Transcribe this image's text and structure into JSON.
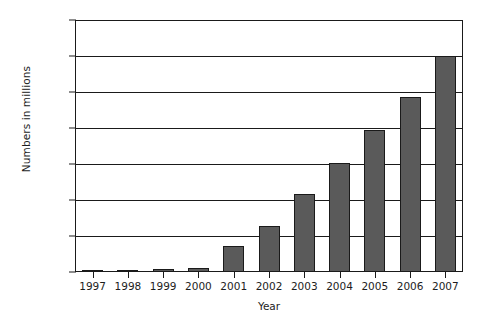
{
  "chart_data": {
    "type": "bar",
    "title": "",
    "xlabel": "Year",
    "ylabel": "Numbers in millions",
    "categories": [
      "1997",
      "1998",
      "1999",
      "2000",
      "2001",
      "2002",
      "2003",
      "2004",
      "2005",
      "2006",
      "2007"
    ],
    "values": [
      1,
      2,
      7,
      10,
      72,
      128,
      218,
      303,
      395,
      487,
      600
    ],
    "ylim": [
      0,
      700
    ],
    "ytick_labels": [
      "0",
      "100",
      "200",
      "300",
      "400",
      "500",
      "600",
      "700"
    ],
    "ytick_values": [
      0,
      100,
      200,
      300,
      400,
      500,
      600,
      700
    ],
    "grid": true,
    "legend": false,
    "series": [
      {
        "name": "Numbers in millions",
        "values": [
          1,
          2,
          7,
          10,
          72,
          128,
          218,
          303,
          395,
          487,
          600
        ]
      }
    ],
    "colors": {
      "bar_fill": "#5a5a5a",
      "bar_stroke": "#1a1a1a",
      "axis": "#1a1a1a",
      "grid": "#1a1a1a",
      "text": "#1d1d1d",
      "background": "#ffffff"
    }
  }
}
